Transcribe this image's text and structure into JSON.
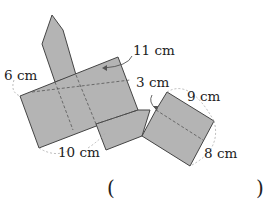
{
  "diagram": {
    "fill_color": "#b4b4b4",
    "stroke_color": "#444444",
    "labels": {
      "six": "6 cm",
      "eleven": "11 cm",
      "three": "3 cm",
      "nine": "9 cm",
      "ten": "10 cm",
      "eight": "8 cm"
    },
    "answer": {
      "open": "(",
      "close": ")"
    }
  }
}
